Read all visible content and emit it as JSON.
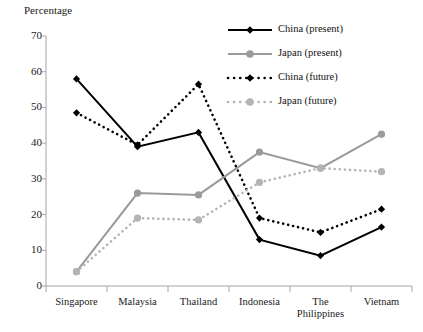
{
  "chart_data": {
    "type": "line",
    "title": "",
    "ylabel": "Percentage",
    "xlabel": "",
    "categories": [
      "Singapore",
      "Malaysia",
      "Thailand",
      "Indonesia",
      "The\nPhilippines",
      "Vietnam"
    ],
    "ylim": [
      0,
      70
    ],
    "ytick_values": [
      0,
      10,
      20,
      30,
      40,
      50,
      60,
      70
    ],
    "ytick_labels": [
      "0",
      "10",
      "20",
      "30",
      "40",
      "50",
      "60",
      "70"
    ],
    "grid": false,
    "legend_position": "top-right",
    "series": [
      {
        "name": "China (present)",
        "values": [
          58,
          39,
          43,
          13,
          8.5,
          16.5
        ],
        "color": "#000000",
        "line_style": "solid",
        "marker": "diamond"
      },
      {
        "name": "Japan (present)",
        "values": [
          4,
          26,
          25.5,
          37.5,
          33,
          42.5
        ],
        "color": "#9a9a9a",
        "line_style": "solid",
        "marker": "circle"
      },
      {
        "name": "China (future)",
        "values": [
          48.5,
          39.5,
          56.5,
          19,
          15,
          21.5
        ],
        "color": "#000000",
        "line_style": "dotted",
        "marker": "diamond"
      },
      {
        "name": "Japan (future)",
        "values": [
          4,
          19,
          18.5,
          29,
          33,
          32
        ],
        "color": "#b4b4b4",
        "line_style": "dotted",
        "marker": "circle"
      }
    ]
  },
  "axis": {
    "color": "#a6a6a6"
  }
}
